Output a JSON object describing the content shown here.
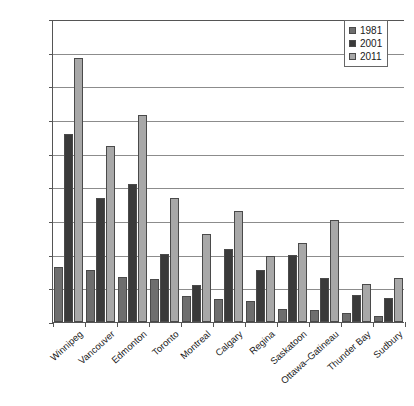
{
  "chart_data": {
    "type": "bar",
    "title": "",
    "xlabel": "",
    "ylabel": "",
    "ylim": [
      0,
      90000
    ],
    "ytick_labels": [
      "90,000",
      "80,000",
      "70,000",
      "60,000",
      "50,000",
      "40,000",
      "30,000",
      "20,000",
      "10,000",
      "0"
    ],
    "ytick_values": [
      90000,
      80000,
      70000,
      60000,
      50000,
      40000,
      30000,
      20000,
      10000,
      0
    ],
    "grid": true,
    "legend_position": "top-right",
    "categories": [
      "Winnipeg",
      "Vancouver",
      "Edmonton",
      "Toronto",
      "Montreal",
      "Calgary",
      "Regina",
      "Saskatoon",
      "Ottawa–Gatineau",
      "Thunder Bay",
      "Sudbury"
    ],
    "series": [
      {
        "name": "1981",
        "color": "#6e6e6e",
        "values": [
          16200,
          15400,
          13300,
          12800,
          7700,
          6800,
          6300,
          3900,
          3700,
          2700,
          1700
        ]
      },
      {
        "name": "2001",
        "color": "#3a3a3a",
        "values": [
          55800,
          36900,
          40900,
          20200,
          10900,
          21700,
          15400,
          20000,
          13200,
          7900,
          7100
        ]
      },
      {
        "name": "2011",
        "color": "#a8a8a8",
        "values": [
          78300,
          52300,
          61500,
          36800,
          26100,
          33100,
          19600,
          23600,
          30200,
          11300,
          13000
        ]
      }
    ]
  },
  "legend": {
    "entries": [
      {
        "label": "1981"
      },
      {
        "label": "2001"
      },
      {
        "label": "2011"
      }
    ]
  }
}
